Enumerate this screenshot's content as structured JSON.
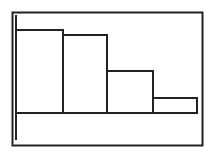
{
  "colors": {
    "stroke": "#222222",
    "background": "#ffffff",
    "bar_fill": "#ffffff"
  },
  "chart_data": {
    "type": "bar",
    "title": "",
    "xlabel": "",
    "ylabel": "",
    "categories": [
      "1",
      "2",
      "3",
      "4"
    ],
    "values": [
      83,
      78,
      42,
      15
    ],
    "ylim": [
      0,
      100
    ],
    "grid": false,
    "legend": null
  }
}
